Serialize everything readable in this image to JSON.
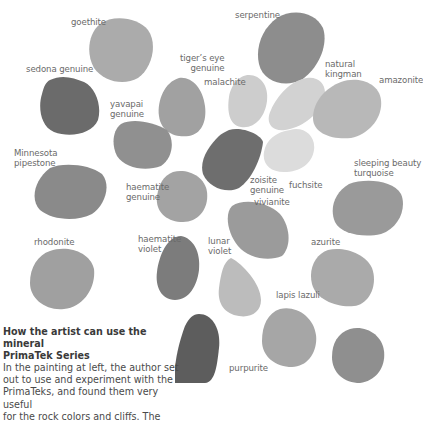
{
  "swatches": [
    {
      "name": "goethite",
      "label": "goethite",
      "color": "#a9a9a9"
    },
    {
      "name": "serpentine",
      "label": "serpentine",
      "color": "#8c8c8c"
    },
    {
      "name": "sedona-genuine",
      "label": "sedona genuine",
      "color": "#6a6a6a"
    },
    {
      "name": "tigers-eye-genuine",
      "label_lines": [
        "tiger’s eye",
        "genuine"
      ],
      "color": "#a3a3a3"
    },
    {
      "name": "malachite",
      "label": "malachite",
      "color": "#cfcfcf"
    },
    {
      "name": "natural-kingman",
      "label_lines": [
        "natural",
        "kingman"
      ],
      "color": "#d3d3d3"
    },
    {
      "name": "amazonite",
      "label": "amazonite",
      "color": "#b9b9b9"
    },
    {
      "name": "yavapai-genuine",
      "label_lines": [
        "yavapai",
        "genuine"
      ],
      "color": "#8f8f8f"
    },
    {
      "name": "minnesota-pipestone",
      "label_lines": [
        "Minnesota",
        "pipestone"
      ],
      "color": "#8a8a8a"
    },
    {
      "name": "zoisite-genuine",
      "label_lines": [
        "zoisite",
        "genuine"
      ],
      "color": "#707070"
    },
    {
      "name": "fuchsite",
      "label": "fuchsite",
      "color": "#dadada"
    },
    {
      "name": "haematite-genuine",
      "label_lines": [
        "haematite",
        "genuine"
      ],
      "color": "#a4a4a4"
    },
    {
      "name": "sleeping-beauty-turquoise",
      "label_lines": [
        "sleeping beauty",
        "turquoise"
      ],
      "color": "#9a9a9a"
    },
    {
      "name": "vivianite",
      "label": "vivianite",
      "color": "#9b9b9b"
    },
    {
      "name": "rhodonite",
      "label": "rhodonite",
      "color": "#9f9f9f"
    },
    {
      "name": "haematite-violet",
      "label_lines": [
        "haematite",
        "violet"
      ],
      "color": "#7d7d7d"
    },
    {
      "name": "lunar-violet",
      "label_lines": [
        "lunar",
        "violet"
      ],
      "color": "#bdbdbd"
    },
    {
      "name": "azurite",
      "label": "azurite",
      "color": "#a9a9a9"
    },
    {
      "name": "lapis-lazuli",
      "label": "lapis lazuli",
      "color": "#a6a6a6"
    },
    {
      "name": "purpurite",
      "label": "purpurite",
      "color": "#5e5e5e"
    },
    {
      "name": "unlabeled-bottom-right",
      "color": "#8e8e8e"
    }
  ],
  "labels": {
    "goethite": "goethite",
    "serpentine": "serpentine",
    "sedona": "sedona genuine",
    "tigers_eye_1": "tiger’s eye",
    "tigers_eye_2": "genuine",
    "malachite": "malachite",
    "kingman_1": "natural",
    "kingman_2": "kingman",
    "amazonite": "amazonite",
    "yavapai_1": "yavapai",
    "yavapai_2": "genuine",
    "minnesota_1": "Minnesota",
    "minnesota_2": "pipestone",
    "haematite_g_1": "haematite",
    "haematite_g_2": "genuine",
    "zoisite_1": "zoisite",
    "zoisite_2": "genuine",
    "fuchsite": "fuchsite",
    "sleeping_1": "sleeping beauty",
    "sleeping_2": "turquoise",
    "vivianite": "vivianite",
    "rhodonite": "rhodonite",
    "haematite_v_1": "haematite",
    "haematite_v_2": "violet",
    "lunar_1": "lunar",
    "lunar_2": "violet",
    "azurite": "azurite",
    "lapis": "lapis lazuli",
    "purpurite": "purpurite"
  },
  "caption": {
    "title_line1": "How the artist can use the mineral",
    "title_line2": "PrimaTek Series",
    "body_lines": [
      "In the painting at left, the author set",
      "out to use and experiment with the",
      "PrimaTeks, and found them very useful",
      "for the rock colors and cliffs. The"
    ]
  }
}
